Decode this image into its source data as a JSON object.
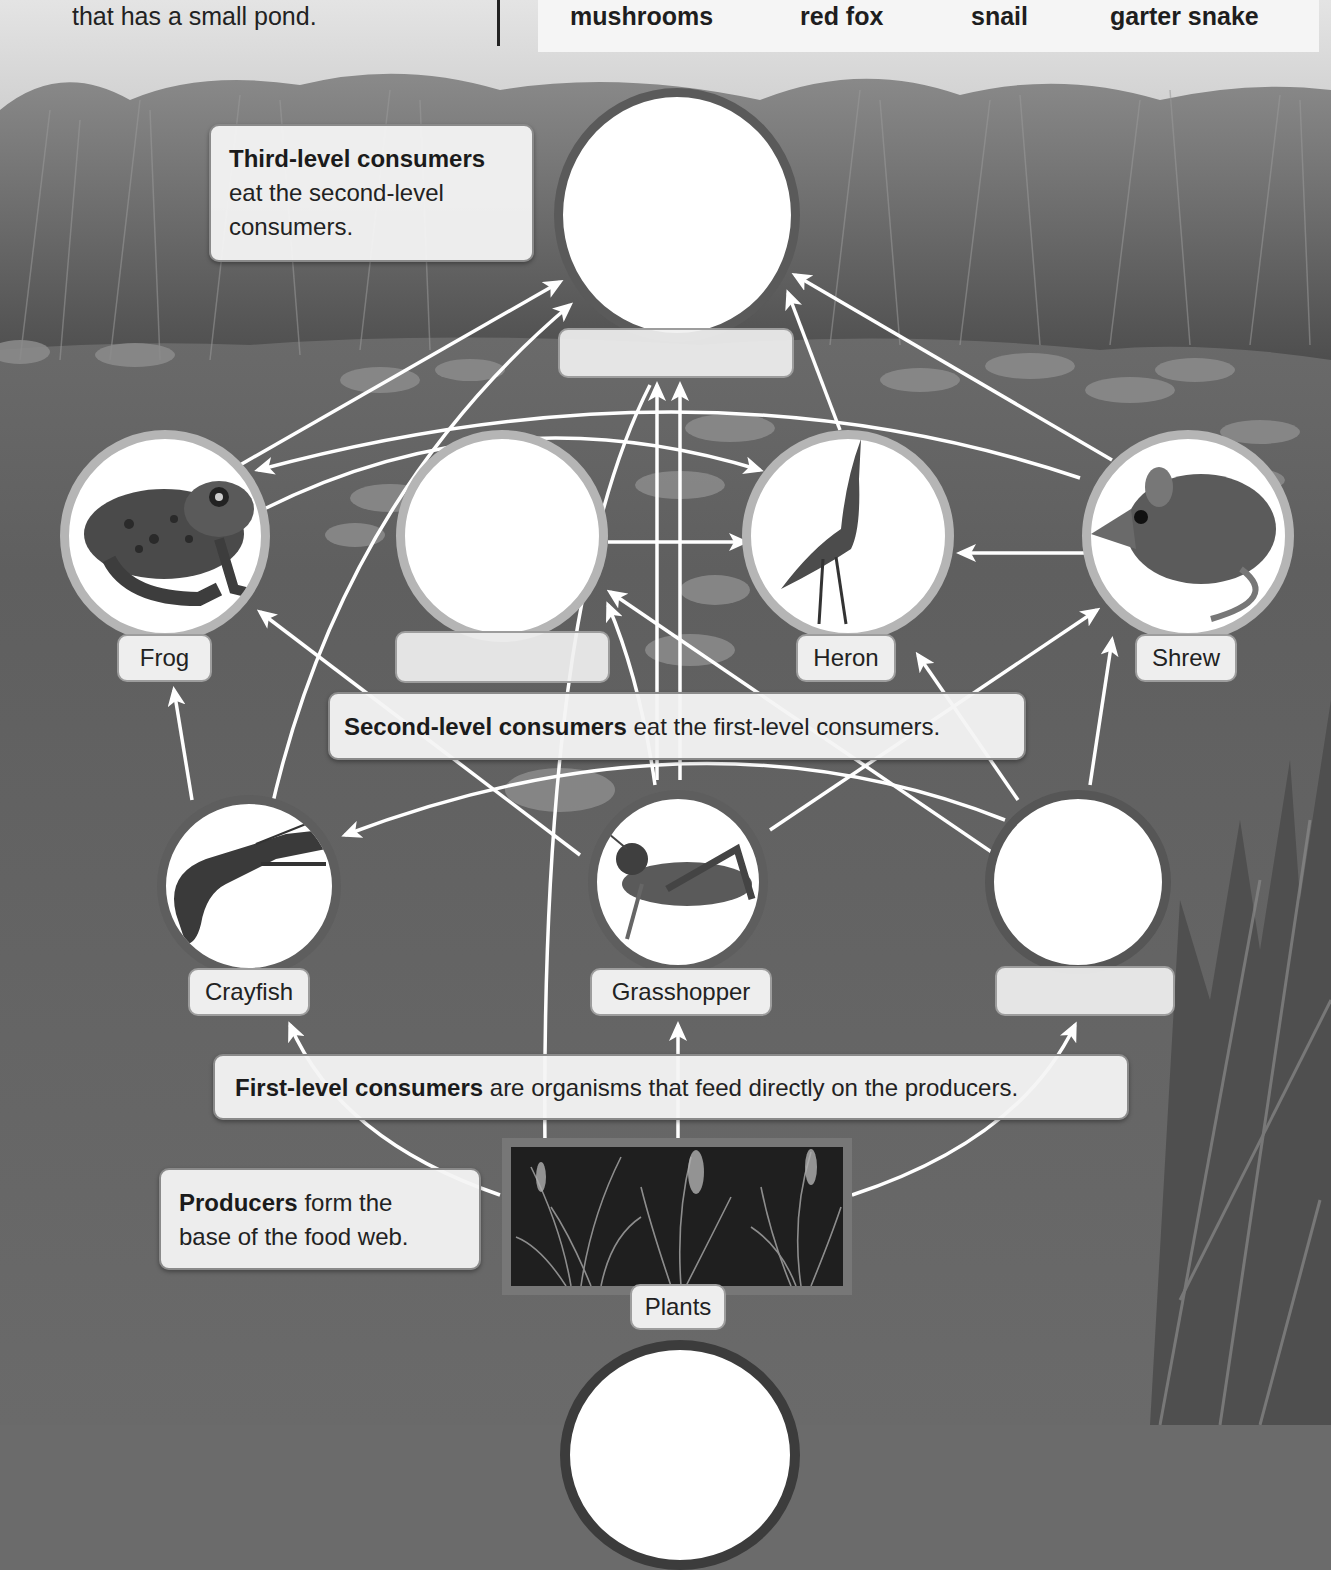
{
  "intro": {
    "text": "that has a small pond."
  },
  "word_bank": {
    "items": [
      "mushrooms",
      "red fox",
      "snail",
      "garter snake"
    ]
  },
  "callouts": {
    "third_level": {
      "bold": "Third-level consumers",
      "line1_rest": "",
      "line2": "eat the second-level",
      "line3": "consumers."
    },
    "second_level": {
      "bold": "Second-level consumers",
      "rest": " eat the first-level consumers."
    },
    "first_level": {
      "bold": "First-level consumers",
      "rest": " are organisms that feed directly on the producers."
    },
    "producers": {
      "bold": "Producers",
      "line1_rest": " form the",
      "line2": "base of the food web."
    }
  },
  "organisms": {
    "third_level_blank": {
      "label": ""
    },
    "frog": {
      "label": "Frog"
    },
    "second_level_blank": {
      "label": ""
    },
    "heron": {
      "label": "Heron"
    },
    "shrew": {
      "label": "Shrew"
    },
    "crayfish": {
      "label": "Crayfish"
    },
    "grasshopper": {
      "label": "Grasshopper"
    },
    "first_level_blank": {
      "label": ""
    },
    "plants": {
      "label": "Plants"
    },
    "decomposer_blank": {
      "label": ""
    }
  },
  "colors": {
    "oval_dark_border": "#5a5a5a",
    "oval_light_border": "#b5b5b5",
    "arrow": "#ffffff",
    "callout_bg": "#f4f4f4",
    "water": "#6b6b6b",
    "sky": "#d8d8d8"
  }
}
